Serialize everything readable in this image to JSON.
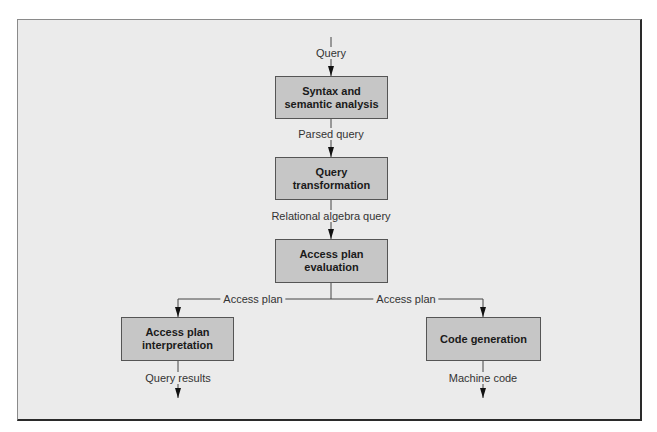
{
  "diagram": {
    "title": "",
    "nodes": [
      {
        "id": "syntax",
        "label": "Syntax and semantic analysis"
      },
      {
        "id": "transform",
        "label": "Query transformation"
      },
      {
        "id": "evaluation",
        "label": "Access plan evaluation"
      },
      {
        "id": "interpretation",
        "label": "Access plan interpretation"
      },
      {
        "id": "codegen",
        "label": "Code generation"
      }
    ],
    "edges": [
      {
        "from": "input",
        "to": "syntax",
        "label": "Query"
      },
      {
        "from": "syntax",
        "to": "transform",
        "label": "Parsed query"
      },
      {
        "from": "transform",
        "to": "evaluation",
        "label": "Relational algebra query"
      },
      {
        "from": "evaluation",
        "to": "interpretation",
        "label": "Access plan"
      },
      {
        "from": "evaluation",
        "to": "codegen",
        "label": "Access plan"
      },
      {
        "from": "interpretation",
        "to": "output",
        "label": "Query results"
      },
      {
        "from": "codegen",
        "to": "output",
        "label": "Machine code"
      }
    ]
  },
  "colors": {
    "background": "#ebebeb",
    "box_fill": "#c6c6c6",
    "line": "#333333"
  }
}
